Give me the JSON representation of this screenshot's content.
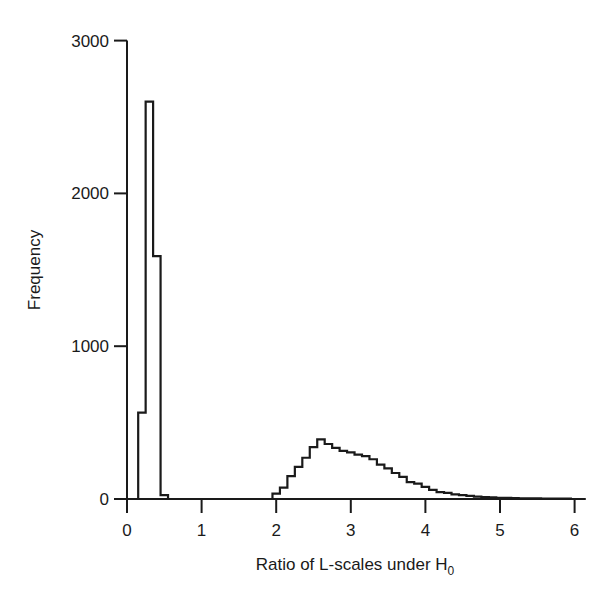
{
  "chart_data": {
    "type": "bar",
    "subtype": "histogram-step",
    "title": "",
    "xlabel": "Ratio of L-scales under H",
    "xlabel_subscript": "0",
    "ylabel": "Frequency",
    "xlim": [
      0,
      6.2
    ],
    "ylim": [
      0,
      3000
    ],
    "x_ticks": [
      0,
      1,
      2,
      3,
      4,
      5,
      6
    ],
    "x_tick_labels": [
      "0",
      "1",
      "2",
      "3",
      "4",
      "5",
      "6"
    ],
    "y_ticks": [
      0,
      1000,
      2000,
      3000
    ],
    "y_tick_labels": [
      "0",
      "1000",
      "2000",
      "3000"
    ],
    "grid": false,
    "legend": null,
    "bin_width": 0.1,
    "bins": [
      {
        "x0": 0.15,
        "count": 565
      },
      {
        "x0": 0.25,
        "count": 2600
      },
      {
        "x0": 0.35,
        "count": 1590
      },
      {
        "x0": 0.45,
        "count": 25
      },
      {
        "x0": 1.95,
        "count": 35
      },
      {
        "x0": 2.05,
        "count": 75
      },
      {
        "x0": 2.15,
        "count": 150
      },
      {
        "x0": 2.25,
        "count": 210
      },
      {
        "x0": 2.35,
        "count": 270
      },
      {
        "x0": 2.45,
        "count": 340
      },
      {
        "x0": 2.55,
        "count": 390
      },
      {
        "x0": 2.65,
        "count": 360
      },
      {
        "x0": 2.75,
        "count": 335
      },
      {
        "x0": 2.85,
        "count": 315
      },
      {
        "x0": 2.95,
        "count": 305
      },
      {
        "x0": 3.05,
        "count": 290
      },
      {
        "x0": 3.15,
        "count": 280
      },
      {
        "x0": 3.25,
        "count": 260
      },
      {
        "x0": 3.35,
        "count": 225
      },
      {
        "x0": 3.45,
        "count": 200
      },
      {
        "x0": 3.55,
        "count": 170
      },
      {
        "x0": 3.65,
        "count": 145
      },
      {
        "x0": 3.75,
        "count": 110
      },
      {
        "x0": 3.85,
        "count": 100
      },
      {
        "x0": 3.95,
        "count": 80
      },
      {
        "x0": 4.05,
        "count": 60
      },
      {
        "x0": 4.15,
        "count": 45
      },
      {
        "x0": 4.25,
        "count": 40
      },
      {
        "x0": 4.35,
        "count": 30
      },
      {
        "x0": 4.45,
        "count": 25
      },
      {
        "x0": 4.55,
        "count": 20
      },
      {
        "x0": 4.65,
        "count": 15
      },
      {
        "x0": 4.75,
        "count": 12
      },
      {
        "x0": 4.85,
        "count": 10
      },
      {
        "x0": 4.95,
        "count": 8
      },
      {
        "x0": 5.05,
        "count": 7
      },
      {
        "x0": 5.15,
        "count": 6
      },
      {
        "x0": 5.25,
        "count": 5
      },
      {
        "x0": 5.35,
        "count": 5
      },
      {
        "x0": 5.45,
        "count": 4
      },
      {
        "x0": 5.55,
        "count": 3
      },
      {
        "x0": 5.65,
        "count": 3
      },
      {
        "x0": 5.75,
        "count": 2
      },
      {
        "x0": 5.85,
        "count": 2
      }
    ],
    "colors": {
      "line": "#1a1a1a",
      "background": "#ffffff"
    }
  }
}
